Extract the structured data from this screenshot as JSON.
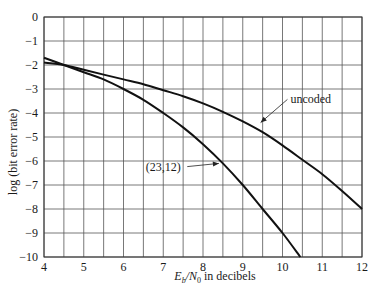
{
  "chart_data": {
    "type": "line",
    "title": "",
    "xlabel_main": "E",
    "xlabel_sub1": "b",
    "xlabel_mid": "/N",
    "xlabel_sub2": "0",
    "xlabel_tail": " in decibels",
    "xlabel": "E_b/N_0 in decibels",
    "ylabel": "log (bit error rate)",
    "xlim": [
      4,
      12
    ],
    "ylim": [
      -10,
      0
    ],
    "x_ticks": [
      4,
      5,
      6,
      7,
      8,
      9,
      10,
      11,
      12
    ],
    "y_ticks": [
      0,
      -1,
      -2,
      -3,
      -4,
      -5,
      -6,
      -7,
      -8,
      -9,
      -10
    ],
    "x_tick_labels": [
      "4",
      "5",
      "6",
      "7",
      "8",
      "9",
      "10",
      "11",
      "12"
    ],
    "y_tick_labels": [
      "0",
      "−1",
      "−2",
      "−3",
      "−4",
      "−5",
      "−6",
      "−7",
      "−8",
      "−9",
      "−10"
    ],
    "grid": {
      "x_step": 0.5,
      "y_step": 1,
      "on": true
    },
    "legend": "none (inline annotations)",
    "series": [
      {
        "name": "uncoded",
        "x": [
          4.0,
          4.5,
          5.0,
          5.5,
          6.0,
          6.5,
          7.0,
          7.5,
          8.0,
          8.5,
          9.0,
          9.5,
          10.0,
          10.5,
          11.0,
          11.5,
          12.0
        ],
        "y": [
          -1.9,
          -2.0,
          -2.2,
          -2.4,
          -2.6,
          -2.8,
          -3.05,
          -3.3,
          -3.6,
          -3.95,
          -4.35,
          -4.8,
          -5.35,
          -5.95,
          -6.55,
          -7.25,
          -8.0
        ]
      },
      {
        "name": "(23,12)",
        "x": [
          4.0,
          4.5,
          5.0,
          5.5,
          6.0,
          6.5,
          7.0,
          7.5,
          8.0,
          8.5,
          9.0,
          9.5,
          10.0,
          10.45
        ],
        "y": [
          -1.7,
          -2.0,
          -2.3,
          -2.6,
          -3.0,
          -3.45,
          -4.0,
          -4.6,
          -5.3,
          -6.1,
          -7.0,
          -8.0,
          -9.0,
          -10.0
        ]
      }
    ],
    "annotations": [
      {
        "text": "uncoded",
        "points_to": "uncoded",
        "at": [
          9.45,
          -4.4
        ],
        "label_pos": [
          10.2,
          -3.6
        ]
      },
      {
        "text": "(23,12)",
        "points_to": "(23,12)",
        "at": [
          8.4,
          -6.1
        ],
        "label_pos": [
          7.0,
          -6.4
        ]
      }
    ]
  }
}
